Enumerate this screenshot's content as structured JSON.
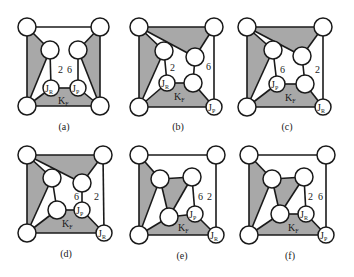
{
  "figure": {
    "panels": [
      {
        "id": "a",
        "caption": "(a)",
        "numbers": [
          "2",
          "6"
        ],
        "node_labels": {
          "jr": "J",
          "jr_sub": "R",
          "jp": "J",
          "jp_sub": "P",
          "face": "K",
          "face_sub": "F"
        }
      },
      {
        "id": "b",
        "caption": "(b)",
        "numbers": [
          "2",
          "6"
        ],
        "node_labels": {
          "jr": "J",
          "jr_sub": "R",
          "jp": "J",
          "jp_sub": "P",
          "face": "K",
          "face_sub": "F"
        }
      },
      {
        "id": "c",
        "caption": "(c)",
        "numbers": [
          "6",
          "2"
        ],
        "node_labels": {
          "jp": "J",
          "jp_sub": "P",
          "jr": "J",
          "jr_sub": "R",
          "face": "K",
          "face_sub": "F"
        }
      },
      {
        "id": "d",
        "caption": "(d)",
        "numbers": [
          "6",
          "2"
        ],
        "node_labels": {
          "jp": "J",
          "jp_sub": "P",
          "jr": "J",
          "jr_sub": "R",
          "face": "K",
          "face_sub": "F"
        }
      },
      {
        "id": "e",
        "caption": "(e)",
        "numbers": [
          "6",
          "2"
        ],
        "node_labels": {
          "jp": "J",
          "jp_sub": "P",
          "jr": "J",
          "jr_sub": "R",
          "face": "K",
          "face_sub": "F"
        }
      },
      {
        "id": "f",
        "caption": "(f)",
        "numbers": [
          "2",
          "6"
        ],
        "node_labels": {
          "jr": "J",
          "jr_sub": "R",
          "jp": "J",
          "jp_sub": "P",
          "face": "K",
          "face_sub": "F"
        }
      }
    ],
    "colors": {
      "shade": "#a8a8a8",
      "stroke": "#1a1a1a",
      "node_fill": "#ffffff"
    }
  }
}
